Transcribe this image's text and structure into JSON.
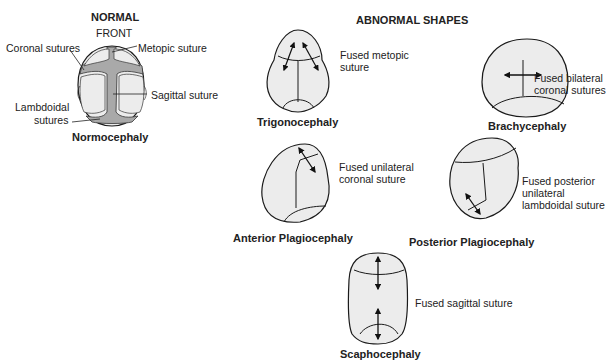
{
  "normal": {
    "heading": "NORMAL",
    "orientation_label": "FRONT",
    "labels": {
      "coronal": "Coronal sutures",
      "metopic": "Metopic suture",
      "sagittal": "Sagittal suture",
      "lambdoidal_1": "Lambdoidal",
      "lambdoidal_2": "sutures"
    },
    "name": "Normocephaly"
  },
  "abnormal": {
    "heading": "ABNORMAL SHAPES",
    "shapes": [
      {
        "name": "Trigonocephaly",
        "description_lines": [
          "Fused metopic",
          "suture"
        ]
      },
      {
        "name": "Brachycephaly",
        "description_lines": [
          "Fused bilateral",
          "coronal sutures"
        ]
      },
      {
        "name": "Anterior Plagiocephaly",
        "description_lines": [
          "Fused unilateral",
          "coronal suture"
        ]
      },
      {
        "name": "Posterior Plagiocephaly",
        "description_lines": [
          "Fused posterior",
          "unilateral",
          "lambdoidal suture"
        ]
      },
      {
        "name": "Scaphocephaly",
        "description_lines": [
          "Fused sagittal suture"
        ]
      }
    ]
  },
  "colors": {
    "skull_fill": "#ececec",
    "suture_fill": "#a9a9a9",
    "outline": "#1a1a1a"
  }
}
